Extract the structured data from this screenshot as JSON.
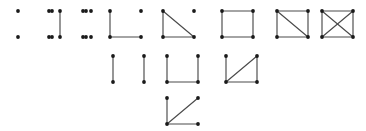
{
  "figure": {
    "background_color": "#ffffff",
    "vertex_color": "#1a1a1a",
    "edge_color": "#4a4a4a",
    "vertex_radius": 1.9,
    "edge_width": 1.15,
    "cell_width": 31,
    "cell_height": 26,
    "vertex_positions": {
      "tl": [
        0,
        0
      ],
      "tr": [
        1,
        0
      ],
      "bl": [
        0,
        1
      ],
      "br": [
        1,
        1
      ]
    },
    "graphs": [
      {
        "name": "empty-graph",
        "edge_count": 0,
        "origin": [
          18,
          11
        ],
        "vertices": [
          "tl",
          "tr",
          "bl",
          "br"
        ],
        "edges": []
      },
      {
        "name": "empty-graph-repeat",
        "edge_count": 0,
        "origin": [
          52,
          11
        ],
        "vertices": [
          "tl",
          "tr",
          "bl",
          "br"
        ],
        "edges": []
      },
      {
        "name": "single-edge-graph",
        "edge_count": 1,
        "origin": [
          60,
          11
        ],
        "vertices": [
          "tl",
          "tr",
          "bl",
          "br"
        ],
        "edges": [
          [
            "tl",
            "bl"
          ]
        ]
      },
      {
        "name": "two-isolated-vertices",
        "edge_count": 0,
        "origin": [
          86,
          11
        ],
        "vertices": [
          "tl",
          "bl"
        ],
        "edges": []
      },
      {
        "name": "path-p3-plus-isolated-vertex",
        "edge_count": 2,
        "origin": [
          110,
          11
        ],
        "vertices": [
          "tl",
          "tr",
          "bl",
          "br"
        ],
        "edges": [
          [
            "tl",
            "bl"
          ],
          [
            "bl",
            "br"
          ]
        ]
      },
      {
        "name": "triangle-plus-isolated-vertex",
        "edge_count": 3,
        "origin": [
          163,
          11
        ],
        "vertices": [
          "tl",
          "tr",
          "bl",
          "br"
        ],
        "edges": [
          [
            "tl",
            "bl"
          ],
          [
            "bl",
            "br"
          ],
          [
            "tl",
            "br"
          ]
        ]
      },
      {
        "name": "cycle-c4",
        "edge_count": 4,
        "origin": [
          222,
          11
        ],
        "vertices": [
          "tl",
          "tr",
          "bl",
          "br"
        ],
        "edges": [
          [
            "tl",
            "tr"
          ],
          [
            "tr",
            "br"
          ],
          [
            "br",
            "bl"
          ],
          [
            "bl",
            "tl"
          ]
        ]
      },
      {
        "name": "diamond-graph",
        "edge_count": 5,
        "origin": [
          277,
          11
        ],
        "vertices": [
          "tl",
          "tr",
          "bl",
          "br"
        ],
        "edges": [
          [
            "tl",
            "tr"
          ],
          [
            "tr",
            "br"
          ],
          [
            "br",
            "bl"
          ],
          [
            "bl",
            "tl"
          ],
          [
            "tl",
            "br"
          ]
        ]
      },
      {
        "name": "complete-graph-k4",
        "edge_count": 6,
        "origin": [
          322,
          11
        ],
        "vertices": [
          "tl",
          "tr",
          "bl",
          "br"
        ],
        "edges": [
          [
            "tl",
            "tr"
          ],
          [
            "tr",
            "br"
          ],
          [
            "br",
            "bl"
          ],
          [
            "bl",
            "tl"
          ],
          [
            "tl",
            "br"
          ],
          [
            "tr",
            "bl"
          ]
        ]
      },
      {
        "name": "perfect-matching-two-edges",
        "edge_count": 2,
        "origin": [
          113,
          56
        ],
        "vertices": [
          "tl",
          "tr",
          "bl",
          "br"
        ],
        "edges": [
          [
            "tl",
            "bl"
          ],
          [
            "tr",
            "br"
          ]
        ]
      },
      {
        "name": "path-p4",
        "edge_count": 3,
        "origin": [
          167,
          56
        ],
        "vertices": [
          "tl",
          "tr",
          "bl",
          "br"
        ],
        "edges": [
          [
            "tl",
            "bl"
          ],
          [
            "bl",
            "br"
          ],
          [
            "br",
            "tr"
          ]
        ]
      },
      {
        "name": "paw-graph-triangle-with-pendant",
        "edge_count": 4,
        "origin": [
          226,
          56
        ],
        "vertices": [
          "tl",
          "tr",
          "bl",
          "br"
        ],
        "edges": [
          [
            "tl",
            "bl"
          ],
          [
            "bl",
            "br"
          ],
          [
            "bl",
            "tr"
          ],
          [
            "br",
            "tr"
          ]
        ]
      },
      {
        "name": "star-k13-claw",
        "edge_count": 3,
        "origin": [
          167,
          98
        ],
        "vertices": [
          "tl",
          "tr",
          "bl",
          "br"
        ],
        "edges": [
          [
            "tl",
            "bl"
          ],
          [
            "bl",
            "br"
          ],
          [
            "bl",
            "tr"
          ]
        ]
      }
    ]
  }
}
